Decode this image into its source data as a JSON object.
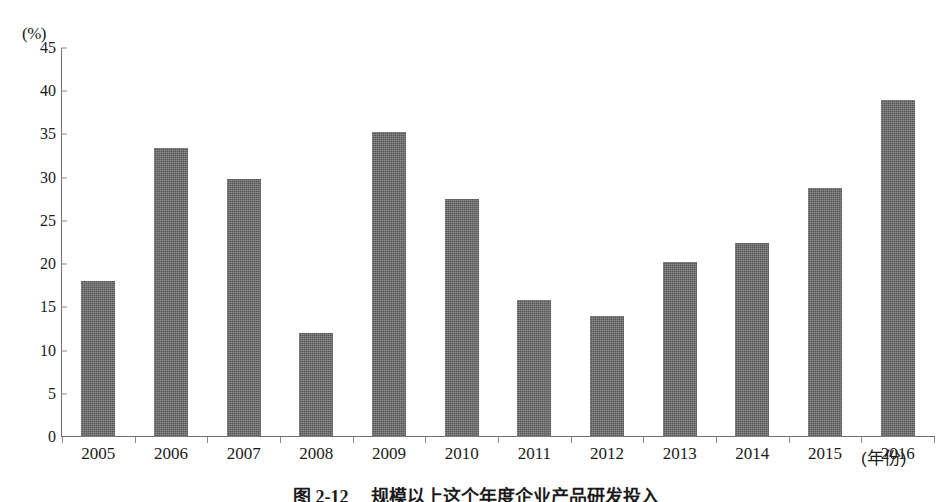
{
  "figure": {
    "caption": "图 2-12　 规模以上这个年度企业产品研发投入",
    "y_unit_label": "(%)",
    "x_unit_label": "(年份)"
  },
  "chart_data": {
    "type": "bar",
    "title": "",
    "xlabel": "(年份)",
    "ylabel": "(%)",
    "categories": [
      "2005",
      "2006",
      "2007",
      "2008",
      "2009",
      "2010",
      "2011",
      "2012",
      "2013",
      "2014",
      "2015",
      "2016"
    ],
    "values": [
      18.1,
      33.4,
      29.9,
      12.0,
      35.3,
      27.5,
      15.8,
      14.0,
      20.2,
      22.4,
      28.8,
      39.0
    ],
    "ylim": [
      0,
      45
    ],
    "yticks": [
      "0",
      "5",
      "10",
      "15",
      "20",
      "25",
      "30",
      "35",
      "40",
      "45"
    ],
    "ytick_values": [
      0,
      5,
      10,
      15,
      20,
      25,
      30,
      35,
      40,
      45
    ],
    "grid": false,
    "legend": "none",
    "bar_color": "#6a6a6a",
    "axis_color": "#6f6f6f"
  }
}
